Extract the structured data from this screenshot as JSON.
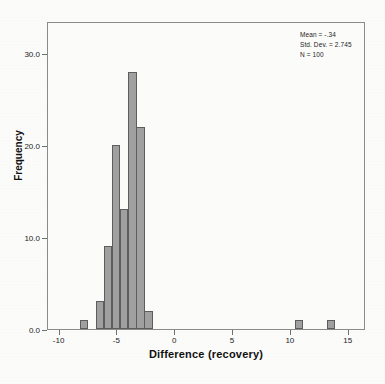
{
  "chart_data": {
    "type": "bar",
    "chart_subtype": "histogram",
    "title": "",
    "xlabel": "Difference (recovery)",
    "ylabel": "Frequency",
    "xlim": [
      -11.0,
      16.5
    ],
    "ylim": [
      0,
      33.5
    ],
    "xticks": [
      -10,
      -5,
      0,
      5,
      10,
      15
    ],
    "xticklabels": [
      "-10",
      "-5",
      "0",
      "5",
      "10",
      "15"
    ],
    "yticks": [
      0.0,
      10.0,
      20.0,
      30.0
    ],
    "yticklabels": [
      "0.0",
      "10.0",
      "20.0",
      "30.0"
    ],
    "grid": false,
    "legend": false,
    "bin_width": 0.72,
    "bar_color": "#a0a0a0",
    "bar_edge_color": "#5d5d5d",
    "bins": [
      {
        "center": -7.9,
        "value": 1
      },
      {
        "center": -6.5,
        "value": 3
      },
      {
        "center": -5.8,
        "value": 9
      },
      {
        "center": -5.1,
        "value": 20
      },
      {
        "center": -4.4,
        "value": 13
      },
      {
        "center": -3.7,
        "value": 28
      },
      {
        "center": -3.0,
        "value": 22
      },
      {
        "center": -2.3,
        "value": 2
      },
      {
        "center": 10.7,
        "value": 1
      },
      {
        "center": 13.5,
        "value": 1
      }
    ],
    "categories": [
      "-7.9",
      "-6.5",
      "-5.8",
      "-5.1",
      "-4.4",
      "-3.7",
      "-3.0",
      "-2.3",
      "10.7",
      "13.5"
    ],
    "values": [
      1,
      3,
      9,
      20,
      13,
      28,
      22,
      2,
      1,
      1
    ],
    "annotations": {
      "mean_label": "Mean = -.34",
      "std_dev_label": "Std. Dev. = 2.745",
      "n_label": "N = 100"
    },
    "statistics": {
      "mean": -0.34,
      "std_dev": 2.745,
      "n": 100
    }
  }
}
